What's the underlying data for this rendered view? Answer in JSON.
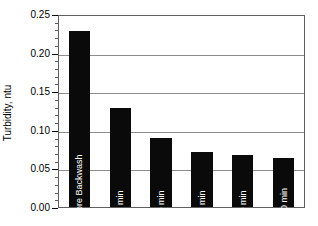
{
  "chart_data": {
    "type": "bar",
    "title": "",
    "xlabel": "",
    "ylabel": "Turbidity, ntu",
    "categories": [
      "Filter 3 before Backwash",
      "15 min",
      "30 min",
      "45 min",
      "60 min",
      "120 min"
    ],
    "values": [
      0.23,
      0.13,
      0.09,
      0.072,
      0.068,
      0.064
    ],
    "ylim": [
      0.0,
      0.25
    ],
    "ytick_labels": [
      "0.00",
      "0.05",
      "0.10",
      "0.15",
      "0.20",
      "0.25"
    ],
    "ytick_values": [
      0.0,
      0.05,
      0.1,
      0.15,
      0.2,
      0.25
    ],
    "minor_tick_step": 0.01,
    "grid": "horizontal",
    "legend": "none",
    "bar_color": "#0a0a0a",
    "bar_label_color": "#ffffff",
    "grid_color": "#8c8c8c",
    "axis_color": "#5f5f5f",
    "background_color": "#ffffff"
  }
}
